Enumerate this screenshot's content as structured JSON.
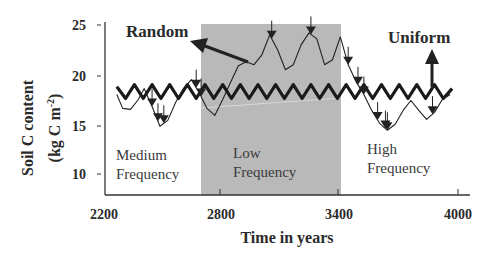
{
  "chart_data": {
    "type": "line",
    "title": "",
    "xlabel": "Time in years",
    "ylabel": "Soil C content",
    "ylabel_units": "(kg C m-2)",
    "xlim": [
      2200,
      4000
    ],
    "ylim": [
      8,
      25
    ],
    "x_ticks": [
      2200,
      2800,
      3400,
      4000
    ],
    "y_ticks": [
      10,
      15,
      20,
      25
    ],
    "grid": false,
    "shaded_region": {
      "x_start": 2740,
      "x_end": 3420,
      "color": "#b8b8b8",
      "label": "Low Frequency"
    },
    "regions": [
      {
        "label_line1": "Medium",
        "label_line2": "Frequency",
        "x_start": 2200,
        "x_end": 2740
      },
      {
        "label_line1": "Low",
        "label_line2": "Frequency",
        "x_start": 2740,
        "x_end": 3420
      },
      {
        "label_line1": "High",
        "label_line2": "Frequency",
        "x_start": 3420,
        "x_end": 4000
      }
    ],
    "series": [
      {
        "name": "Uniform",
        "style": "thick zigzag",
        "description": "Regular oscillation between ~17.5 and ~19 with period ~90 years",
        "x": [
          2260,
          2305,
          2350,
          2395,
          2440,
          2485,
          2530,
          2575,
          2620,
          2665,
          2710,
          2755,
          2800,
          2845,
          2890,
          2935,
          2980,
          3025,
          3070,
          3115,
          3160,
          3205,
          3250,
          3295,
          3340,
          3385,
          3430,
          3475,
          3520,
          3565,
          3610,
          3655,
          3700,
          3745,
          3790,
          3835,
          3880,
          3925,
          3970
        ],
        "values": [
          18.8,
          17.6,
          19.0,
          17.6,
          19.0,
          17.6,
          19.0,
          17.6,
          19.0,
          17.6,
          19.0,
          17.6,
          19.0,
          17.6,
          19.0,
          17.6,
          19.0,
          17.6,
          19.0,
          17.6,
          19.0,
          17.6,
          19.0,
          17.6,
          19.0,
          17.6,
          19.0,
          17.6,
          19.0,
          17.6,
          19.0,
          17.6,
          19.0,
          17.6,
          19.0,
          17.6,
          19.0,
          17.6,
          18.6
        ]
      },
      {
        "name": "Random",
        "style": "thin line",
        "x": [
          2260,
          2290,
          2330,
          2370,
          2400,
          2440,
          2480,
          2520,
          2560,
          2600,
          2640,
          2680,
          2720,
          2760,
          2800,
          2840,
          2880,
          2920,
          2960,
          3000,
          3040,
          3080,
          3120,
          3160,
          3200,
          3240,
          3280,
          3320,
          3360,
          3400,
          3440,
          3480,
          3520,
          3560,
          3600,
          3640,
          3680,
          3720,
          3760,
          3800,
          3840,
          3880,
          3920,
          3960
        ],
        "values": [
          18.0,
          16.6,
          16.5,
          17.5,
          18.6,
          16.8,
          14.8,
          15.4,
          17.2,
          18.6,
          19.5,
          18.2,
          16.6,
          15.9,
          17.5,
          19.2,
          20.9,
          21.3,
          21.0,
          22.0,
          24.0,
          22.5,
          20.5,
          21.0,
          23.0,
          24.2,
          23.6,
          21.0,
          21.5,
          23.8,
          21.0,
          19.3,
          18.0,
          16.4,
          15.1,
          14.4,
          15.0,
          16.4,
          17.4,
          16.4,
          15.5,
          16.2,
          17.5,
          18.0
        ]
      }
    ],
    "event_markers": {
      "description": "Downward arrows marking disturbance events on the Random series",
      "x": [
        2440,
        2470,
        2500,
        2665,
        2690,
        3050,
        3250,
        3440,
        3490,
        3520,
        3590,
        3630,
        3640,
        3870
      ]
    },
    "annotations": [
      {
        "text": "Random",
        "arrow_to": "Random series"
      },
      {
        "text": "Uniform",
        "arrow_to": "Uniform series"
      }
    ]
  },
  "labels": {
    "x_ticks": [
      "2200",
      "2800",
      "3400",
      "4000"
    ],
    "y_ticks": [
      "25",
      "20",
      "15",
      "10"
    ],
    "x_title": "Time in years",
    "y_title_line1": "Soil C content",
    "y_title_line2": "(kg C m",
    "y_title_sup": "-2",
    "y_title_close": ")",
    "random": "Random",
    "uniform": "Uniform",
    "medium_1": "Medium",
    "medium_2": "Frequency",
    "low_1": "Low",
    "low_2": "Frequency",
    "high_1": "High",
    "high_2": "Frequency"
  }
}
